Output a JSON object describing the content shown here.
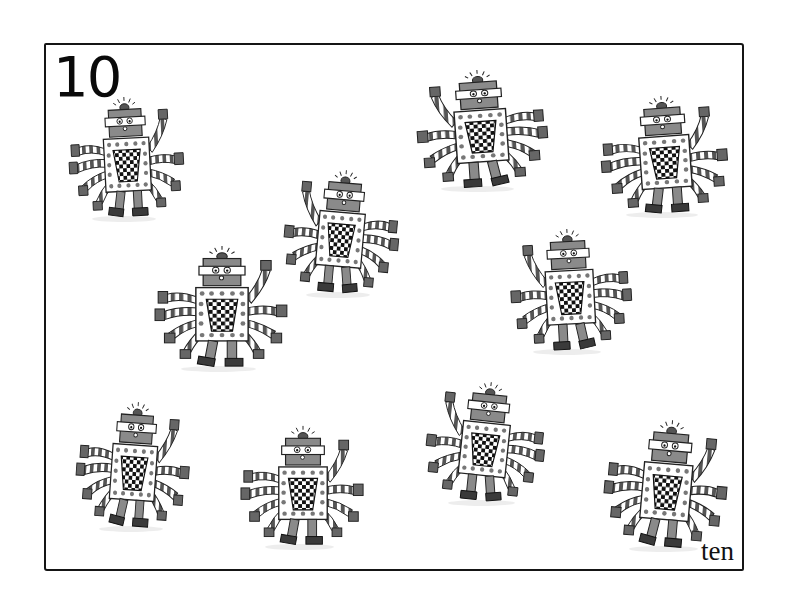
{
  "page": {
    "numeral": "10",
    "word": "ten",
    "count": 10
  },
  "colors": {
    "frame": "#151515",
    "robot_grey": "#8a8a8a",
    "robot_dark": "#3a3a3a",
    "checker_dark": "#111111",
    "background": "#ffffff"
  },
  "robots": [
    {
      "id": 1,
      "x": 68,
      "y": 95,
      "w": 118,
      "h": 125,
      "flip": false,
      "tilt": -3
    },
    {
      "id": 2,
      "x": 414,
      "y": 68,
      "w": 134,
      "h": 122,
      "flip": true,
      "tilt": 4
    },
    {
      "id": 3,
      "x": 600,
      "y": 94,
      "w": 130,
      "h": 122,
      "flip": false,
      "tilt": -4
    },
    {
      "id": 4,
      "x": 282,
      "y": 168,
      "w": 118,
      "h": 128,
      "flip": true,
      "tilt": -5
    },
    {
      "id": 5,
      "x": 154,
      "y": 244,
      "w": 136,
      "h": 126,
      "flip": false,
      "tilt": 0
    },
    {
      "id": 6,
      "x": 508,
      "y": 227,
      "w": 124,
      "h": 126,
      "flip": true,
      "tilt": 3
    },
    {
      "id": 7,
      "x": 76,
      "y": 400,
      "w": 116,
      "h": 130,
      "flip": false,
      "tilt": 4
    },
    {
      "id": 8,
      "x": 240,
      "y": 424,
      "w": 126,
      "h": 124,
      "flip": false,
      "tilt": 0
    },
    {
      "id": 9,
      "x": 424,
      "y": 380,
      "w": 122,
      "h": 124,
      "flip": true,
      "tilt": -6
    },
    {
      "id": 10,
      "x": 604,
      "y": 418,
      "w": 126,
      "h": 132,
      "flip": false,
      "tilt": 5
    }
  ]
}
